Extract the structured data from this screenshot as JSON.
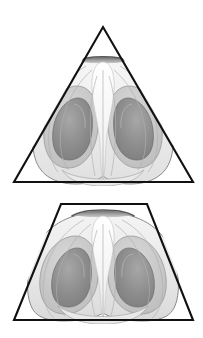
{
  "figure": {
    "background_color": "#ffffff",
    "outline_color": "#111111",
    "panels": [
      {
        "id": "top-panel",
        "frame_shape": "triangle",
        "frame_label": "triangle-frame",
        "frame_points": "103,27 193,182 14,182",
        "surface_label": "surface-plot-triangle"
      },
      {
        "id": "bottom-panel",
        "frame_shape": "trapezoid",
        "frame_label": "trapezoid-frame",
        "frame_points": "61,204 147,204 193,320 14,320",
        "surface_label": "surface-plot-trapezoid"
      }
    ],
    "palette": {
      "outline": "#111111",
      "surface_lightest": "#fafafa",
      "surface_light": "#eeeeee",
      "surface_mid": "#dcdcdc",
      "surface_mid_dark": "#c2c2c2",
      "surface_dark": "#9d9d9d",
      "surface_darkest": "#7e7e7e",
      "contour_line": "#8a8a8a",
      "cap_shadow": "#6f6f6f"
    }
  },
  "caption": {
    "text": "",
    "visible_fragment": ""
  }
}
